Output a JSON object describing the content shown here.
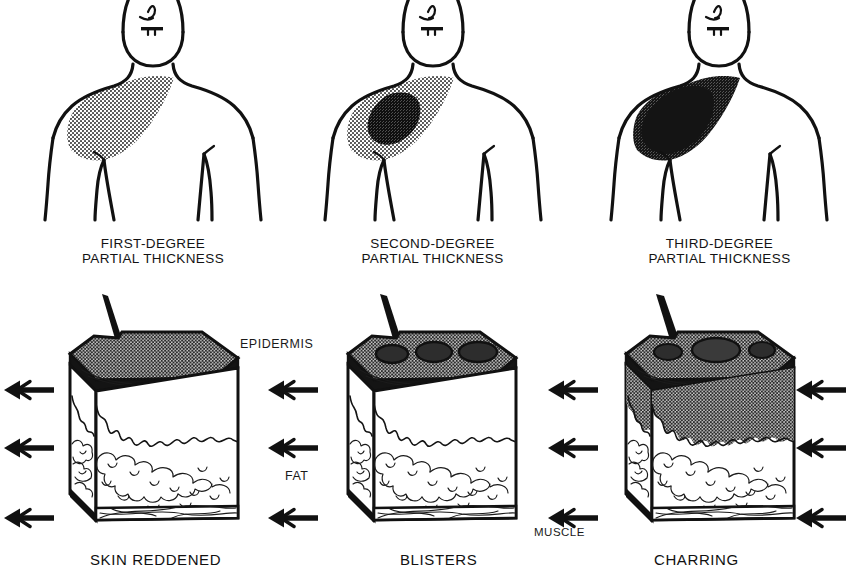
{
  "figure": {
    "title_text_present": false,
    "columns": [
      {
        "id": "first-degree",
        "top_caption": "FIRST-DEGREE\nPARTIAL THICKNESS",
        "bottom_label": "SKIN REDDENED",
        "burn_depth_description": "superficial stipple on shoulder/chest",
        "shading": {
          "outer": "#8e8e8e",
          "inner": "none"
        },
        "block": {
          "epidermis_shaded": true,
          "blisters": 0,
          "dermis_shaded": false,
          "wedge_depth": "mid-dermis"
        }
      },
      {
        "id": "second-degree",
        "top_caption": "SECOND-DEGREE\nPARTIAL THICKNESS",
        "bottom_label": "BLISTERS",
        "burn_depth_description": "light stipple with dark inner core",
        "shading": {
          "outer": "#8e8e8e",
          "inner": "#3a3a3a"
        },
        "block": {
          "epidermis_shaded": true,
          "blisters": 3,
          "dermis_shaded": false,
          "wedge_depth": "deep-dermis into fat"
        }
      },
      {
        "id": "third-degree",
        "top_caption": "THIRD-DEGREE\nPARTIAL THICKNESS",
        "bottom_label": "CHARRING",
        "burn_depth_description": "largely black/charred region",
        "shading": {
          "outer": "#6b6b6b",
          "inner": "#151515"
        },
        "block": {
          "epidermis_shaded": true,
          "blisters": 3,
          "dermis_shaded": true,
          "wedge_depth": "through fat"
        }
      }
    ],
    "layer_annotations": [
      {
        "id": "epidermis",
        "label": "EPIDERMIS"
      },
      {
        "id": "fat",
        "label": "FAT"
      },
      {
        "id": "muscle",
        "label": "MUSCLE"
      }
    ],
    "arrow_rows": [
      {
        "id": "epidermis-row",
        "points_to": "EPIDERMIS"
      },
      {
        "id": "fat-row",
        "points_to": "FAT"
      },
      {
        "id": "muscle-row",
        "points_to": "MUSCLE"
      }
    ],
    "arrow_direction": "left",
    "colors": {
      "ink": "#111111",
      "paper": "#ffffff",
      "stipple_light": "#8e8e8e",
      "stipple_dark": "#3a3a3a",
      "char": "#151515"
    }
  }
}
